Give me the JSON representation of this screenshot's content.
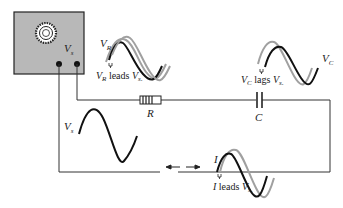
{
  "diagram": {
    "type": "series RC circuit phase diagram",
    "source": {
      "label": "V",
      "label_sub": "s",
      "box_color": "#b8b8b8",
      "knob": "dial-icon"
    },
    "components": {
      "resistor": {
        "label": "R"
      },
      "capacitor": {
        "label": "C"
      }
    },
    "waveforms": {
      "source": {
        "label": "V",
        "label_sub": "s"
      },
      "resistor_voltage": {
        "label": "V",
        "label_sub": "R",
        "caption_prefix": "V",
        "caption_prefix_sub": "R",
        "caption_mid": " leads ",
        "caption_ref": "V",
        "caption_ref_sub": "s",
        "caption_end": "."
      },
      "capacitor_voltage": {
        "label": "V",
        "label_sub": "C",
        "caption_prefix": "V",
        "caption_prefix_sub": "C",
        "caption_mid": " lags ",
        "caption_ref": "V",
        "caption_ref_sub": "s",
        "caption_end": "."
      },
      "current": {
        "label": "I",
        "caption_prefix": "I",
        "caption_mid": " leads ",
        "caption_ref": "V",
        "caption_ref_sub": "s",
        "caption_end": "."
      }
    },
    "colors": {
      "wire": "#333333",
      "wave_dark": "#1a1a1a",
      "wave_light": "#a0a0a0",
      "box": "#b8b8b8"
    }
  }
}
